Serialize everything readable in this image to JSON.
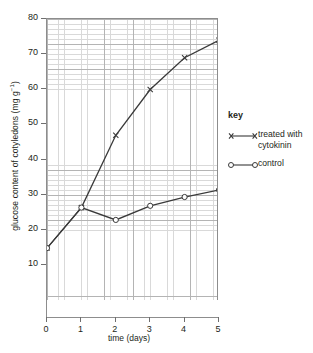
{
  "chart_data": {
    "type": "line",
    "title": "",
    "xlabel": "time (days)",
    "ylabel_text": "glucose content of cotyledons (mg g",
    "ylabel_sup": "−1",
    "ylabel_tail": ")",
    "x": [
      0,
      1,
      2,
      3,
      4,
      5
    ],
    "xticks": [
      "0",
      "1",
      "2",
      "3",
      "4",
      "5"
    ],
    "yticks": [
      "10",
      "20",
      "30",
      "40",
      "50",
      "60",
      "70",
      "80"
    ],
    "xlim": [
      0,
      5
    ],
    "ylim": [
      0,
      80
    ],
    "grid": "graph-paper minor and major gridlines",
    "legend_position": "right",
    "series": [
      {
        "name": "treated with cytokinin",
        "marker": "cross",
        "values": [
          15,
          26.5,
          47,
          60,
          69,
          74
        ]
      },
      {
        "name": "control",
        "marker": "open-circle",
        "values": [
          15,
          26.5,
          23,
          27,
          29.5,
          31.5
        ]
      }
    ]
  },
  "legend": {
    "title": "key",
    "items": [
      {
        "label": "treated with cytokinin",
        "marker": "cross"
      },
      {
        "label": "control",
        "marker": "open-circle"
      }
    ]
  },
  "colors": {
    "line": "#3a3a3a",
    "axis": "#8d8d8d",
    "grid_minor": "#d9d9d9",
    "grid_major": "#b4b4b4",
    "text": "#231f20"
  }
}
